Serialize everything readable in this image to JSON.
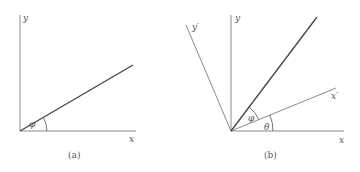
{
  "panels": [
    {
      "caption": "(a)",
      "axis_labels": {
        "x": "x",
        "y": "y"
      },
      "angle_labels": [
        "φ"
      ]
    },
    {
      "caption": "(b)",
      "axis_labels": {
        "x": "x",
        "y": "y",
        "x_prime": "x′",
        "y_prime": "y′"
      },
      "angle_labels": [
        "φ",
        "θ"
      ]
    }
  ],
  "colors": {
    "axis": "#888888",
    "vector": "#444444",
    "text": "#555555"
  }
}
